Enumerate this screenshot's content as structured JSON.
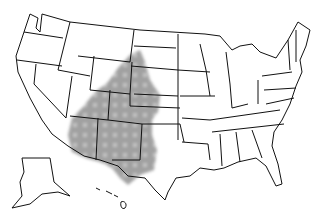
{
  "map": {
    "title": "United States range map",
    "region_label": "Shaded range",
    "shade_color": "#9a9a9a",
    "outline_color": "#111111",
    "background": "#ffffff",
    "shaded_states": [
      "Wyoming (SE)",
      "South Dakota (W)",
      "Nebraska",
      "Colorado",
      "Kansas (W)",
      "Utah (SE)",
      "Arizona",
      "New Mexico",
      "Oklahoma (W)",
      "Texas (W)"
    ],
    "insets": [
      "Alaska",
      "Hawaii"
    ]
  }
}
